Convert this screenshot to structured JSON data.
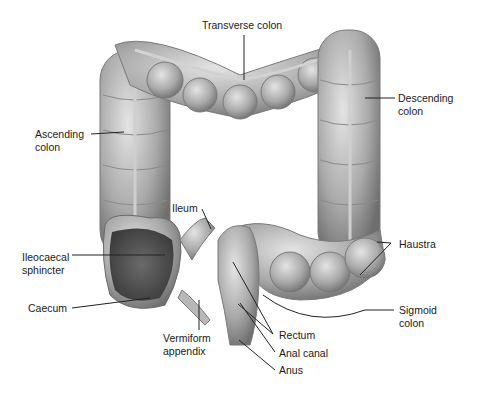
{
  "figure": {
    "labels": {
      "transverse_colon": "Transverse colon",
      "descending_colon_1": "Descending",
      "descending_colon_2": "colon",
      "ascending_colon_1": "Ascending",
      "ascending_colon_2": "colon",
      "ileum": "Ileum",
      "ileocaecal_1": "Ileocaecal",
      "ileocaecal_2": "sphincter",
      "caecum": "Caecum",
      "appendix_1": "Vermiform",
      "appendix_2": "appendix",
      "haustra": "Haustra",
      "sigmoid_1": "Sigmoid",
      "sigmoid_2": "colon",
      "rectum": "Rectum",
      "anal_canal": "Anal canal",
      "anus": "Anus"
    }
  }
}
